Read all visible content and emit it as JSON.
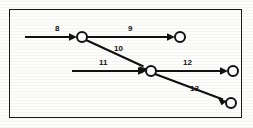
{
  "figure": {
    "type": "activity-on-arrow-network",
    "border_color": "#1a1a1a",
    "line_color": "#111111",
    "node_fill": "#ffffff",
    "background": "#fdfdfc"
  },
  "nodes": [
    {
      "id": "node-a",
      "label": "",
      "cx": 82,
      "cy": 37,
      "r": 5.0
    },
    {
      "id": "node-b",
      "label": "",
      "cx": 180,
      "cy": 37,
      "r": 5.0
    },
    {
      "id": "node-c",
      "label": "",
      "cx": 151,
      "cy": 71,
      "r": 5.0
    },
    {
      "id": "node-d",
      "label": "",
      "cx": 233,
      "cy": 71,
      "r": 5.0
    },
    {
      "id": "node-e",
      "label": "",
      "cx": 231,
      "cy": 103,
      "r": 5.0
    }
  ],
  "edges": [
    {
      "id": "edge-8",
      "label": "8",
      "from": "source-left-upper",
      "to": "node-a",
      "x1": 25,
      "y1": 37,
      "x2": 77,
      "y2": 37,
      "label_x": 57,
      "label_y": 24
    },
    {
      "id": "edge-9",
      "label": "9",
      "from": "node-a",
      "to": "node-b",
      "x1": 87,
      "y1": 37,
      "x2": 175,
      "y2": 37,
      "label_x": 130,
      "label_y": 24
    },
    {
      "id": "edge-10",
      "label": "10",
      "from": "node-a",
      "to": "node-c",
      "x1": 86,
      "y1": 40,
      "x2": 147,
      "y2": 68,
      "label_x": 118,
      "label_y": 44
    },
    {
      "id": "edge-11",
      "label": "11",
      "from": "source-left-lower",
      "to": "node-c",
      "x1": 72,
      "y1": 71,
      "x2": 146,
      "y2": 71,
      "label_x": 103,
      "label_y": 58
    },
    {
      "id": "edge-12",
      "label": "12",
      "from": "node-c",
      "to": "node-d",
      "x1": 156,
      "y1": 71,
      "x2": 228,
      "y2": 71,
      "label_x": 187,
      "label_y": 58
    },
    {
      "id": "edge-13",
      "label": "13",
      "from": "node-c",
      "to": "node-e",
      "x1": 155,
      "y1": 74,
      "x2": 227,
      "y2": 101,
      "label_x": 194,
      "label_y": 84
    }
  ],
  "labels": {
    "e8": "8",
    "e9": "9",
    "e10": "10",
    "e11": "11",
    "e12": "12",
    "e13": "13"
  }
}
